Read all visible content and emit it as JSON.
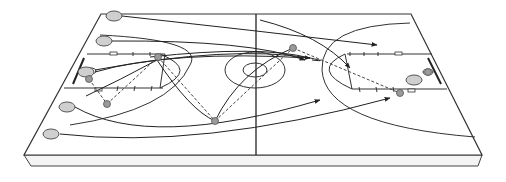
{
  "diagram": {
    "type": "basketball-play-diagram",
    "view": "perspective isometric court",
    "colors": {
      "line": "#333333",
      "court_fill": "#ffffff",
      "slab_side": "#f2f2f2",
      "player_disc": "#cfcfcf",
      "player_disc_edge": "#555555",
      "ball_marker": "#9a9a9a",
      "pass_line": "#444444"
    },
    "players_left": [
      {
        "id": "p1",
        "x": 114,
        "y": 16
      },
      {
        "id": "p2",
        "x": 104,
        "y": 41
      },
      {
        "id": "p3",
        "x": 86,
        "y": 72
      },
      {
        "id": "p4",
        "x": 67,
        "y": 107
      },
      {
        "id": "p5",
        "x": 51,
        "y": 134
      }
    ],
    "players_right": [
      {
        "id": "d1",
        "x": 414,
        "y": 80
      }
    ],
    "ball_markers": [
      {
        "id": "b1",
        "x": 89,
        "y": 79
      },
      {
        "id": "b2",
        "x": 158,
        "y": 57
      },
      {
        "id": "b3",
        "x": 107,
        "y": 104
      },
      {
        "id": "b4",
        "x": 215,
        "y": 121
      },
      {
        "id": "b5",
        "x": 293,
        "y": 48
      },
      {
        "id": "b6",
        "x": 400,
        "y": 93
      },
      {
        "id": "b7",
        "x": 428,
        "y": 72
      }
    ]
  }
}
